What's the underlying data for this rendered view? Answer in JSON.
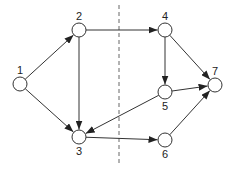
{
  "diagram": {
    "type": "directed-graph",
    "nodes": [
      {
        "id": "1",
        "label": "1",
        "x": 20,
        "y": 84,
        "label_pos": "above"
      },
      {
        "id": "2",
        "label": "2",
        "x": 79,
        "y": 30,
        "label_pos": "above"
      },
      {
        "id": "3",
        "label": "3",
        "x": 79,
        "y": 137,
        "label_pos": "below"
      },
      {
        "id": "4",
        "label": "4",
        "x": 165,
        "y": 30,
        "label_pos": "above"
      },
      {
        "id": "5",
        "label": "5",
        "x": 165,
        "y": 92,
        "label_pos": "below"
      },
      {
        "id": "6",
        "label": "6",
        "x": 165,
        "y": 140,
        "label_pos": "below"
      },
      {
        "id": "7",
        "label": "7",
        "x": 215,
        "y": 85,
        "label_pos": "above"
      }
    ],
    "edges": [
      {
        "from": "1",
        "to": "2"
      },
      {
        "from": "1",
        "to": "3"
      },
      {
        "from": "2",
        "to": "3"
      },
      {
        "from": "2",
        "to": "4"
      },
      {
        "from": "3",
        "to": "6"
      },
      {
        "from": "4",
        "to": "5"
      },
      {
        "from": "4",
        "to": "7"
      },
      {
        "from": "5",
        "to": "3"
      },
      {
        "from": "5",
        "to": "7"
      },
      {
        "from": "6",
        "to": "7"
      }
    ],
    "cut_line": {
      "x": 119,
      "y1": 5,
      "y2": 166,
      "style": "dashed"
    },
    "node_radius": 7,
    "colors": {
      "stroke": "#333333",
      "cut": "#666666",
      "fill": "#ffffff"
    }
  }
}
